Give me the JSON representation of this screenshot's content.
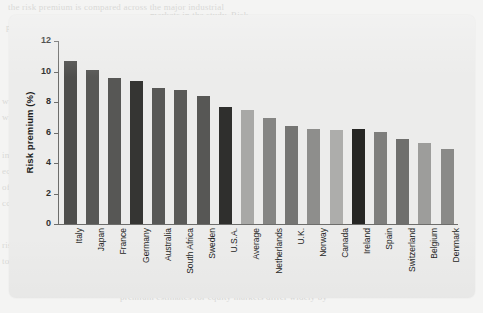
{
  "background": {
    "bleed_text_note": "faint illegible bleed-through text from scanned page",
    "bleed_lines": [
      "the risk premium is compared across the major industrial",
      "markets in the study. Risk",
      "premium estimates for equity markets differ widely by",
      "country. As noted, the country",
      "with the highest measured risk premium over the period",
      "while the lowest was",
      "in these",
      "equity",
      "of the",
      "comparison",
      "risk premium",
      "to measure the"
    ]
  },
  "chart_data": {
    "type": "bar",
    "title": "",
    "xlabel": "",
    "ylabel": "Risk premium (%)",
    "ylim": [
      0,
      12
    ],
    "yticks": [
      0,
      2,
      4,
      6,
      8,
      10,
      12
    ],
    "ytick_labels": [
      "0",
      "2",
      "4",
      "6",
      "8",
      "10",
      "12"
    ],
    "grid": false,
    "legend": "none",
    "categories": [
      "Italy",
      "Japan",
      "France",
      "Germany",
      "Australia",
      "South Africa",
      "Sweden",
      "U.S.A.",
      "Average",
      "Netherlands",
      "U.K.",
      "Norway",
      "Canada",
      "Ireland",
      "Spain",
      "Switzerland",
      "Belgium",
      "Denmark"
    ],
    "values": [
      10.7,
      10.1,
      9.6,
      9.4,
      8.9,
      8.8,
      8.4,
      7.65,
      7.45,
      6.95,
      6.45,
      6.25,
      6.15,
      6.2,
      6.05,
      5.55,
      5.3,
      4.9
    ],
    "bar_colors": [
      "#4e4e4c",
      "#575755",
      "#575755",
      "#353533",
      "#585856",
      "#5a5a58",
      "#575755",
      "#2f2f2d",
      "#a8a8a6",
      "#858583",
      "#757573",
      "#8e8e8c",
      "#adadab",
      "#262624",
      "#7e7e7c",
      "#6f6f6d",
      "#9d9d9b",
      "#8a8a88"
    ]
  },
  "colors": {
    "page_background": "#f4f4f3",
    "card_background": "#ececeb",
    "axis": "#6d6d6b",
    "text": "#1f1f1e"
  }
}
